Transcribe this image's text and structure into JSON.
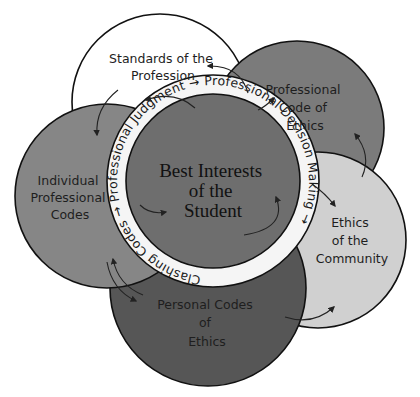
{
  "diagram": {
    "type": "overlapping-circles",
    "center": {
      "label_lines": [
        "Best Interests",
        "of the",
        "Student"
      ],
      "color": "#6f6f6f"
    },
    "ring": {
      "text": "Clashing Codes → Professional Judgment → Professional Decision Making →",
      "color": "#f4f4f4"
    },
    "circles": [
      {
        "id": "standards",
        "label_lines": [
          "Standards of the",
          "Profession"
        ],
        "color": "#ffffff"
      },
      {
        "id": "professional-code",
        "label_lines": [
          "Professional",
          "Code of",
          "Ethics"
        ],
        "color": "#7a7a7a"
      },
      {
        "id": "individual",
        "label_lines": [
          "Individual",
          "Professional",
          "Codes"
        ],
        "color": "#858585"
      },
      {
        "id": "community",
        "label_lines": [
          "Ethics",
          "of the",
          "Community"
        ],
        "color": "#cfcfcf"
      },
      {
        "id": "personal",
        "label_lines": [
          "Personal Codes",
          "of",
          "Ethics"
        ],
        "color": "#555555"
      }
    ]
  }
}
